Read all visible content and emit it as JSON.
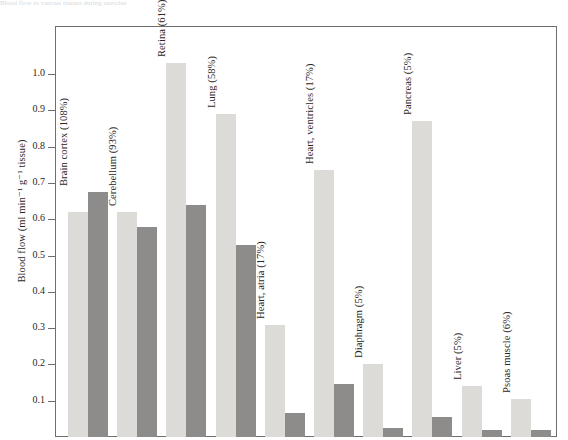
{
  "figure": {
    "top_caption": "Blood flow to various tissues during exercise"
  },
  "chart_data": {
    "type": "bar",
    "title": "",
    "xlabel": "",
    "ylabel": "Blood flow (ml min⁻¹ g⁻¹ tissue)",
    "ylim": [
      0,
      1.13
    ],
    "yticks": [
      0.1,
      0.2,
      0.3,
      0.4,
      0.5,
      0.6,
      0.7,
      0.8,
      0.9,
      1.0
    ],
    "ytick_labels": [
      "0.1",
      "0.2",
      "0.3",
      "0.4",
      "0.5",
      "0.6",
      "0.7",
      "0.8",
      "0.9",
      "1.0"
    ],
    "grid": false,
    "legend": "none",
    "categories": [
      "Brain cortex (108%)",
      "Cerebellum (93%)",
      "Retina (61%)",
      "Lung (58%)",
      "Heart, atria (17%)",
      "Heart, ventricles (17%)",
      "Diaphragm (5%)",
      "Pancreas (5%)",
      "Liver (5%)",
      "Psoas muscle (6%)"
    ],
    "series": [
      {
        "name": "light",
        "color": "#dddbd8",
        "values": [
          0.62,
          0.62,
          1.03,
          0.89,
          0.31,
          0.735,
          0.2,
          0.87,
          0.14,
          0.105
        ]
      },
      {
        "name": "dark",
        "color": "#8d8c8a",
        "values": [
          0.675,
          0.58,
          0.64,
          0.53,
          0.065,
          0.145,
          0.025,
          0.055,
          0.02,
          0.02
        ]
      }
    ]
  },
  "colors": {
    "light_bar": "#dddbd8",
    "dark_bar": "#8d8c8a",
    "frame": "#6f6f6f",
    "text": "#2a2624",
    "background": "#ffffff"
  }
}
